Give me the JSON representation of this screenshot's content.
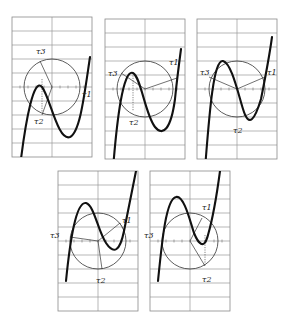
{
  "figure": {
    "panel_size": {
      "w": 80,
      "h": 140
    },
    "rows": 10,
    "panels": [
      {
        "id": 1,
        "x": 12,
        "y": 17,
        "circle": {
          "cx": 40,
          "cy": 70,
          "r": 28
        },
        "curve": "M 8 150 C 14 100, 22 60, 30 70 C 38 80, 46 125, 58 120 C 68 115, 72 80, 78 40",
        "spokes": [
          [
            40,
            70,
            28,
            44
          ],
          [
            40,
            70,
            30,
            98
          ]
        ],
        "dotted": [
          [
            30,
            62,
            30,
            95
          ]
        ],
        "labels": [
          {
            "text": "τ3",
            "x": 24,
            "y": 37
          },
          {
            "text": "τ1",
            "x": 70,
            "y": 80
          },
          {
            "text": "τ2",
            "x": 22,
            "y": 107
          }
        ]
      },
      {
        "id": 2,
        "x": 105,
        "y": 19,
        "circle": {
          "cx": 40,
          "cy": 70,
          "r": 28
        },
        "curve": "M 8 150 C 12 100, 18 50, 28 54 C 36 58, 40 95, 50 108 C 58 118, 66 110, 70 80 C 72 60, 74 45, 76 30",
        "spokes": [
          [
            40,
            70,
            16,
            54
          ],
          [
            40,
            70,
            72,
            59
          ]
        ],
        "dotted": [
          [
            28,
            54,
            28,
            92
          ]
        ],
        "labels": [
          {
            "text": "τ3",
            "x": 3,
            "y": 57
          },
          {
            "text": "τ1",
            "x": 64,
            "y": 46
          },
          {
            "text": "τ2",
            "x": 24,
            "y": 106
          }
        ]
      },
      {
        "id": 3,
        "x": 197,
        "y": 19,
        "circle": {
          "cx": 40,
          "cy": 70,
          "r": 28
        },
        "curve": "M 8 150 C 12 100, 16 40, 26 42 C 34 44, 40 70, 46 90 C 52 110, 58 100, 64 80 C 68 60, 72 40, 75 18",
        "spokes": [
          [
            40,
            70,
            12,
            58
          ],
          [
            40,
            70,
            68,
            58
          ]
        ],
        "dotted": [],
        "labels": [
          {
            "text": "τ3",
            "x": 3,
            "y": 56
          },
          {
            "text": "τ1",
            "x": 70,
            "y": 56
          },
          {
            "text": "τ2",
            "x": 36,
            "y": 114
          }
        ]
      },
      {
        "id": 4,
        "x": 58,
        "y": 171,
        "circle": {
          "cx": 40,
          "cy": 70,
          "r": 28
        },
        "curve": "M 8 110 C 12 70, 18 30, 28 32 C 36 34, 40 60, 48 72 C 56 84, 62 80, 66 60 C 70 40, 74 20, 78 0",
        "spokes": [
          [
            40,
            70,
            12,
            66
          ],
          [
            40,
            70,
            62,
            52
          ],
          [
            40,
            70,
            44,
            98
          ]
        ],
        "dotted": [
          [
            62,
            52,
            66,
            60
          ]
        ],
        "labels": [
          {
            "text": "τ3",
            "x": -8,
            "y": 67
          },
          {
            "text": "τ1",
            "x": 64,
            "y": 52
          },
          {
            "text": "τ2",
            "x": 38,
            "y": 112
          }
        ]
      },
      {
        "id": 5,
        "x": 150,
        "y": 171,
        "circle": {
          "cx": 40,
          "cy": 70,
          "r": 28
        },
        "curve": "M 8 110 C 12 70, 16 28, 26 26 C 34 24, 40 50, 44 62 C 48 72, 54 80, 58 64 C 62 50, 66 30, 70 0",
        "spokes": [
          [
            40,
            70,
            52,
            47
          ],
          [
            40,
            70,
            55,
            95
          ]
        ],
        "dotted": [
          [
            55,
            64,
            55,
            95
          ]
        ],
        "labels": [
          {
            "text": "τ3",
            "x": -6,
            "y": 67
          },
          {
            "text": "τ1",
            "x": 52,
            "y": 39
          },
          {
            "text": "τ2",
            "x": 52,
            "y": 111
          }
        ]
      }
    ]
  }
}
